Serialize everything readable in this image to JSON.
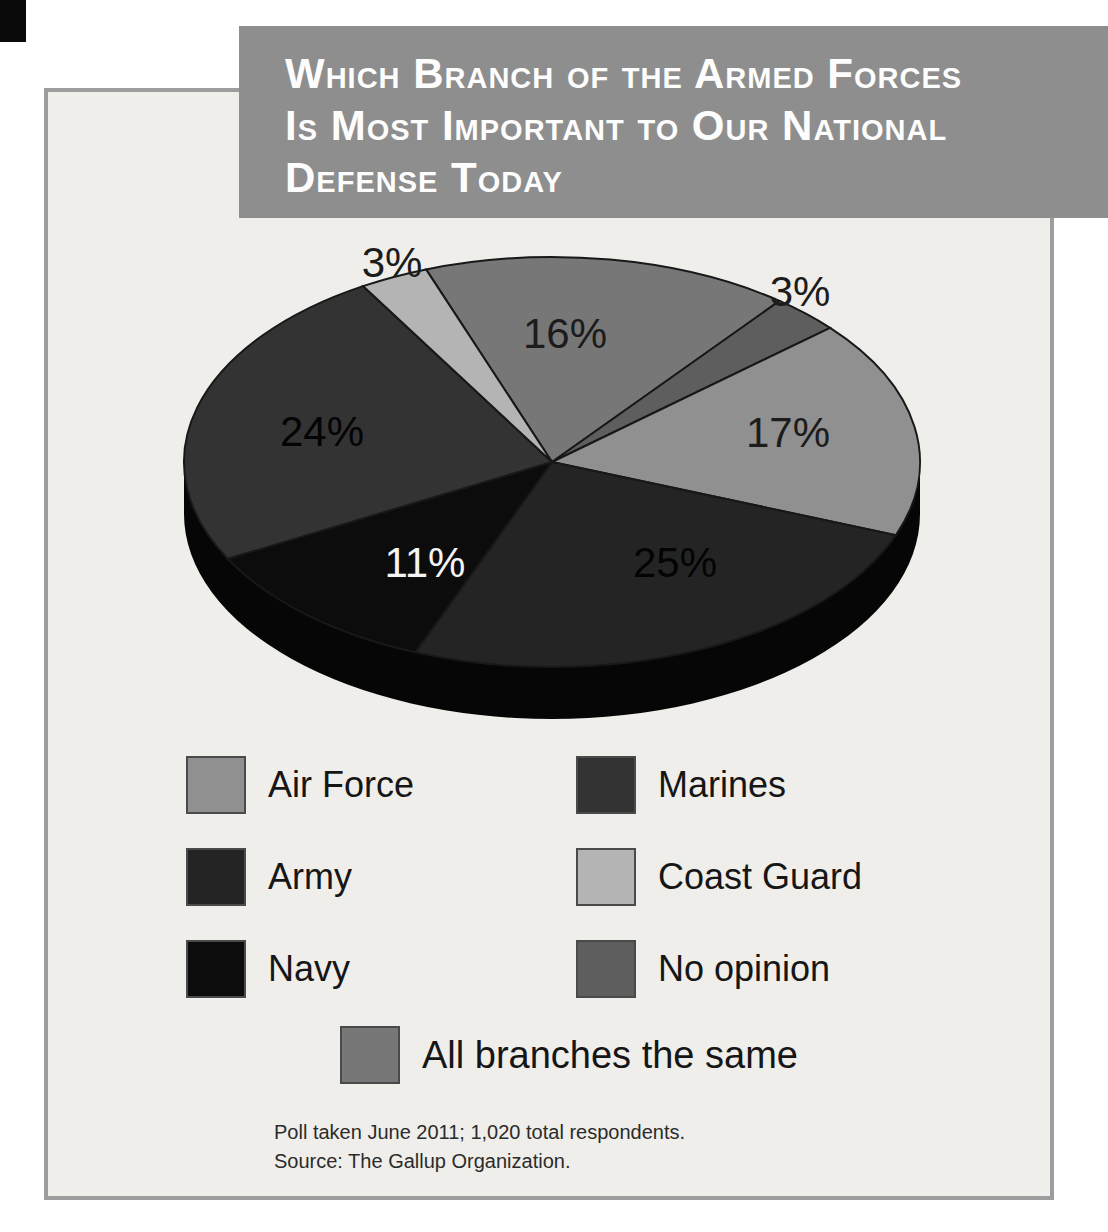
{
  "banner": {
    "bg_color": "#8e8e8e",
    "text_color": "#fdfdfd",
    "lines": [
      "Which Branch of the Armed Forces",
      "Is Most Important to Our National",
      "Defense Today"
    ]
  },
  "chart_data": {
    "type": "pie",
    "title": "Which Branch of the Armed Forces Is Most Important to Our National Defense Today",
    "style": "3d-pie",
    "start_angle_deg_from_12_clockwise": -20,
    "rim_color": "#060606",
    "slices": [
      {
        "id": "all_branches_same",
        "label": "All branches the same",
        "pct": 16,
        "display": "16%",
        "color": "#777777",
        "label_placement": "inside"
      },
      {
        "id": "no_opinion",
        "label": "No opinion",
        "pct": 3,
        "display": "3%",
        "color": "#5e5e5e",
        "label_placement": "outside"
      },
      {
        "id": "air_force",
        "label": "Air Force",
        "pct": 17,
        "display": "17%",
        "color": "#909090",
        "label_placement": "inside"
      },
      {
        "id": "army",
        "label": "Army",
        "pct": 25,
        "display": "25%",
        "color": "#242424",
        "label_placement": "inside"
      },
      {
        "id": "navy",
        "label": "Navy",
        "pct": 11,
        "display": "11%",
        "color": "#0c0c0c",
        "label_placement": "inside"
      },
      {
        "id": "marines",
        "label": "Marines",
        "pct": 24,
        "display": "24%",
        "color": "#333333",
        "label_placement": "inside"
      },
      {
        "id": "coast_guard",
        "label": "Coast Guard",
        "pct": 3,
        "display": "3%",
        "color": "#b4b4b4",
        "label_placement": "outside"
      }
    ],
    "legend_layout": {
      "left": [
        "air_force",
        "army",
        "navy"
      ],
      "right": [
        "marines",
        "coast_guard",
        "no_opinion"
      ],
      "bottom": [
        "all_branches_same"
      ]
    },
    "legend_position": "below"
  },
  "notes": {
    "line1": "Poll taken June 2011; 1,020 total respondents.",
    "line2": "Source: The Gallup Organization."
  }
}
